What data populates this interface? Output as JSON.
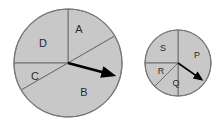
{
  "figure": {
    "background_color": "#ffffff"
  },
  "style": {
    "sector_fill": "#c8c8c8",
    "sector_stroke": "#6e6e6e",
    "outline_color": "#7a7a7a",
    "label_color": "#2b2b2b",
    "arrow_color": "#000000"
  },
  "spinners": [
    {
      "name": "left-spinner",
      "center": {
        "x": 68,
        "y": 63
      },
      "radius": 54,
      "arrow": {
        "angle_deg": -15,
        "length": 50
      },
      "sectors": [
        {
          "id": "A",
          "label": "A",
          "start_deg": 30,
          "end_deg": 90,
          "label_x": 79,
          "label_y": 30
        },
        {
          "id": "D",
          "label": "D",
          "start_deg": 90,
          "end_deg": 180,
          "label_x": 43,
          "label_y": 44
        },
        {
          "id": "C",
          "label": "C",
          "start_deg": 180,
          "end_deg": 210,
          "label_x": 35,
          "label_y": 77
        },
        {
          "id": "B",
          "label": "B",
          "start_deg": 210,
          "end_deg": 390,
          "label_x": 84,
          "label_y": 93
        }
      ]
    },
    {
      "name": "right-spinner",
      "center": {
        "x": 178,
        "y": 63
      },
      "radius": 33,
      "arrow": {
        "angle_deg": -35,
        "length": 31
      },
      "sectors": [
        {
          "id": "P",
          "label": "P",
          "start_deg": -90,
          "end_deg": 90,
          "label_x": 197,
          "label_y": 56
        },
        {
          "id": "S",
          "label": "S",
          "start_deg": 90,
          "end_deg": 180,
          "label_x": 163,
          "label_y": 49
        },
        {
          "id": "R",
          "label": "R",
          "start_deg": 180,
          "end_deg": 225,
          "label_x": 161,
          "label_y": 72
        },
        {
          "id": "Q",
          "label": "Q",
          "start_deg": 225,
          "end_deg": 270,
          "label_x": 176,
          "label_y": 84
        }
      ]
    }
  ]
}
